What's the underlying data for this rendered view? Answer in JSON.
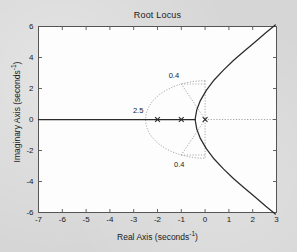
{
  "chart_data": {
    "type": "line",
    "title": "Root Locus",
    "xlabel_text": "Real Axis (seconds",
    "xlabel_sup": "-1",
    "xlabel_close": ")",
    "ylabel_text": "Imaginary Axis (seconds",
    "ylabel_sup": "-1",
    "ylabel_close": ")",
    "xlim": [
      -7,
      3
    ],
    "ylim": [
      -6,
      6
    ],
    "xticks": [
      -7,
      -6,
      -5,
      -4,
      -3,
      -2,
      -1,
      0,
      1,
      2,
      3
    ],
    "xticklabels": [
      "-7",
      "-6",
      "-5",
      "-4",
      "-3",
      "-2",
      "-1",
      "0",
      "1",
      "2",
      "3"
    ],
    "yticks": [
      -6,
      -4,
      -2,
      0,
      2,
      4,
      6
    ],
    "yticklabels": [
      "-6",
      "-4",
      "-2",
      "0",
      "2",
      "4",
      "6"
    ],
    "grid": false,
    "legend": "none",
    "series": [
      {
        "name": "real-axis-locus-segment",
        "type": "line",
        "x": [
          -7,
          -0.42
        ],
        "y": [
          0,
          0
        ]
      },
      {
        "name": "upper-complex-branch",
        "type": "line",
        "x": [
          -0.42,
          -0.35,
          -0.2,
          0.05,
          0.38,
          0.78,
          1.2,
          1.65,
          2.1,
          2.55,
          2.95
        ],
        "y": [
          0,
          0.62,
          1.22,
          1.88,
          2.55,
          3.2,
          3.82,
          4.42,
          5.0,
          5.6,
          6.1
        ]
      },
      {
        "name": "lower-complex-branch",
        "type": "line",
        "x": [
          -0.42,
          -0.35,
          -0.2,
          0.05,
          0.38,
          0.78,
          1.2,
          1.65,
          2.1,
          2.55,
          2.95
        ],
        "y": [
          0,
          -0.62,
          -1.22,
          -1.88,
          -2.55,
          -3.2,
          -3.82,
          -4.42,
          -5.0,
          -5.6,
          -6.1
        ]
      }
    ],
    "open_loop_poles": [
      {
        "marker": "x",
        "x": -2,
        "y": 0
      },
      {
        "marker": "x",
        "x": -1,
        "y": 0
      },
      {
        "marker": "x",
        "x": 0,
        "y": 0
      }
    ],
    "grid_overlays": [
      {
        "name": "natural-frequency-semicircle",
        "label": "2.5",
        "radius": 2.5,
        "style": "dotted",
        "label_x": -2.78,
        "label_y": 0.52
      },
      {
        "name": "damping-ratio-ray-upper",
        "label": "0.4",
        "zeta": 0.4,
        "style": "dotted",
        "label_x": -1.28,
        "label_y": 2.78
      },
      {
        "name": "damping-ratio-ray-lower",
        "label": "0.4",
        "zeta": 0.4,
        "style": "dotted",
        "label_x": -1.05,
        "label_y": -2.92
      },
      {
        "name": "horizontal-dotted-guide",
        "style": "dotted",
        "y": 0,
        "x_from": 0,
        "x_to": 3
      },
      {
        "name": "vertical-dotted-guide",
        "style": "dotted",
        "x": 0,
        "y_from": -2.5,
        "y_to": 2.5
      }
    ],
    "colors": {
      "figure_background": "#d6d6d6",
      "axes_background": "#fdfdfd",
      "axis_line": "#555555",
      "locus_line": "#2b2b2b",
      "grid_overlay": "#9a9a9a",
      "text": "#1a1a1a"
    }
  }
}
